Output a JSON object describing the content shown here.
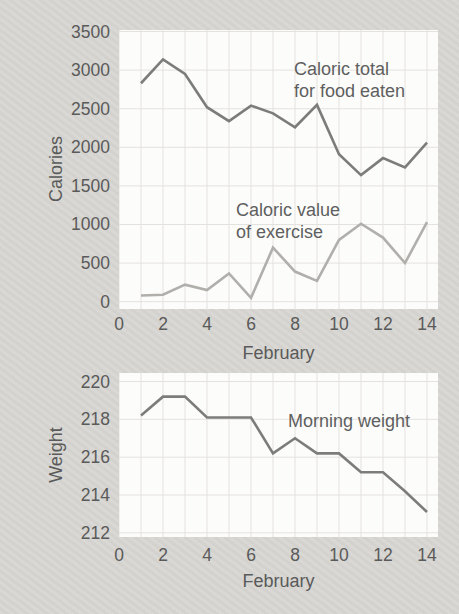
{
  "page": {
    "background": "#d7d6d2",
    "text_color": "#5a5a5a",
    "grid_color": "#e4e2de",
    "plot_background": "#fcfcfb"
  },
  "chart_data": [
    {
      "type": "line",
      "title": "",
      "xlabel": "February",
      "ylabel": "Calories",
      "grid": true,
      "legend_position": "annotated-inline",
      "x": [
        1,
        2,
        3,
        4,
        5,
        6,
        7,
        8,
        9,
        10,
        11,
        12,
        13,
        14
      ],
      "xlim": [
        0,
        14.5
      ],
      "ylim": [
        -95,
        3520
      ],
      "x_ticks": [
        0,
        2,
        4,
        6,
        8,
        10,
        12,
        14
      ],
      "y_ticks": [
        3500,
        3000,
        2500,
        2000,
        1500,
        1000,
        500,
        0
      ],
      "x_gridlines": [
        0,
        1,
        2,
        3,
        4,
        5,
        6,
        7,
        8,
        9,
        10,
        11,
        12,
        13,
        14
      ],
      "y_gridlines": [
        0,
        500,
        1000,
        1500,
        2000,
        2500,
        3000,
        3500
      ],
      "series": [
        {
          "name": "Caloric total for food eaten",
          "color": "#7c7c7a",
          "values": [
            2830,
            3140,
            2950,
            2520,
            2340,
            2540,
            2440,
            2260,
            2550,
            1910,
            1640,
            1860,
            1740,
            2060
          ]
        },
        {
          "name": "Caloric value of exercise",
          "color": "#b0afab",
          "values": [
            80,
            90,
            220,
            150,
            365,
            50,
            700,
            390,
            270,
            800,
            1010,
            830,
            500,
            1030
          ]
        }
      ],
      "annotations": [
        {
          "lines": [
            "Caloric total",
            "for food eaten"
          ],
          "x": 294,
          "y": 58
        },
        {
          "lines": [
            "Caloric value",
            "of exercise"
          ],
          "x": 236,
          "y": 199
        }
      ]
    },
    {
      "type": "line",
      "title": "",
      "xlabel": "February",
      "ylabel": "Weight",
      "grid": true,
      "legend_position": "annotated-inline",
      "x": [
        1,
        2,
        3,
        4,
        5,
        6,
        7,
        8,
        9,
        10,
        11,
        12,
        13,
        14
      ],
      "xlim": [
        0,
        14.5
      ],
      "ylim": [
        211.78,
        220.45
      ],
      "x_ticks": [
        0,
        2,
        4,
        6,
        8,
        10,
        12,
        14
      ],
      "y_ticks": [
        220,
        218,
        216,
        214,
        212
      ],
      "x_gridlines": [
        0,
        1,
        2,
        3,
        4,
        5,
        6,
        7,
        8,
        9,
        10,
        11,
        12,
        13,
        14
      ],
      "y_gridlines": [
        212,
        214,
        216,
        218,
        220
      ],
      "series": [
        {
          "name": "Morning weight",
          "color": "#7c7c7a",
          "values": [
            218.2,
            219.2,
            219.2,
            218.1,
            218.1,
            218.1,
            216.2,
            217.0,
            216.2,
            216.2,
            215.2,
            215.2,
            214.2,
            213.1
          ]
        }
      ],
      "annotations": [
        {
          "lines": [
            "Morning weight"
          ],
          "x": 288,
          "y": 410
        }
      ]
    }
  ]
}
